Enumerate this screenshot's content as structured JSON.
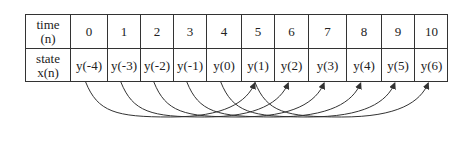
{
  "table": {
    "row_headers": [
      {
        "line1": "time",
        "line2": "(n)"
      },
      {
        "line1": "state",
        "line2": "x(n)"
      }
    ],
    "time": [
      "0",
      "1",
      "2",
      "3",
      "4",
      "5",
      "6",
      "7",
      "8",
      "9",
      "10"
    ],
    "state": [
      "y(-4)",
      "y(-3)",
      "y(-2)",
      "y(-1)",
      "y(0)",
      "y(1)",
      "y(2)",
      "y(3)",
      "y(4)",
      "y(5)",
      "y(6)"
    ]
  },
  "arrows": [
    {
      "from": "y(-4)",
      "to": "y(1)"
    },
    {
      "from": "y(-3)",
      "to": "y(2)"
    },
    {
      "from": "y(-2)",
      "to": "y(3)"
    },
    {
      "from": "y(-1)",
      "to": "y(4)"
    },
    {
      "from": "y(0)",
      "to": "y(5)"
    },
    {
      "from": "y(1)",
      "to": "y(6)"
    }
  ],
  "colors": {
    "line": "#333333",
    "background": "#ffffff"
  }
}
